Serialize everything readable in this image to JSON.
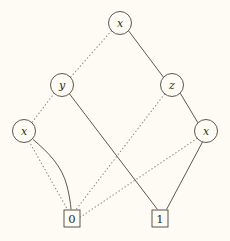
{
  "figure": {
    "kind": "binary-decision-diagram",
    "background_color": "#fdfbf3",
    "line_color": "#4a443c",
    "dotted_line_color": "#8c8478",
    "text_color": "#2e2a24",
    "width": 230,
    "height": 241
  },
  "nodes": [
    {
      "id": "root_x",
      "label": "x",
      "shape": "circle",
      "cx": 120,
      "cy": 23,
      "r": 11.5
    },
    {
      "id": "y",
      "label": "y",
      "shape": "circle",
      "cx": 62,
      "cy": 85,
      "r": 11.5
    },
    {
      "id": "z",
      "label": "z",
      "shape": "circle",
      "cx": 172,
      "cy": 85,
      "r": 11.5
    },
    {
      "id": "x_left",
      "label": "x",
      "shape": "circle",
      "cx": 24,
      "cy": 131,
      "r": 11.5
    },
    {
      "id": "x_right",
      "label": "x",
      "shape": "circle",
      "cx": 206,
      "cy": 131,
      "r": 11.5
    }
  ],
  "terminals": [
    {
      "id": "t0",
      "label": "0",
      "shape": "square",
      "x": 64,
      "y": 210,
      "w": 16,
      "h": 17
    },
    {
      "id": "t1",
      "label": "1",
      "shape": "square",
      "x": 152,
      "y": 210,
      "w": 16,
      "h": 17
    }
  ],
  "edges": [
    {
      "id": "e1",
      "from": "root_x",
      "to": "y",
      "style": "dotted",
      "meaning": "low"
    },
    {
      "id": "e2",
      "from": "root_x",
      "to": "z",
      "style": "solid",
      "meaning": "high"
    },
    {
      "id": "e3",
      "from": "y",
      "to": "x_left",
      "style": "dotted",
      "meaning": "low"
    },
    {
      "id": "e4",
      "from": "y",
      "to": "t1",
      "style": "solid",
      "meaning": "high"
    },
    {
      "id": "e5",
      "from": "z",
      "to": "t0",
      "style": "dotted",
      "meaning": "low"
    },
    {
      "id": "e6",
      "from": "z",
      "to": "x_right",
      "style": "solid",
      "meaning": "high"
    },
    {
      "id": "e7",
      "from": "x_left",
      "to": "t0",
      "style": "dotted",
      "meaning": "low"
    },
    {
      "id": "e8",
      "from": "x_left",
      "to": "t0",
      "style": "solid",
      "meaning": "high",
      "curved": true
    },
    {
      "id": "e9",
      "from": "x_right",
      "to": "t0",
      "style": "dotted",
      "meaning": "low"
    },
    {
      "id": "e10",
      "from": "x_right",
      "to": "t1",
      "style": "solid",
      "meaning": "high"
    }
  ]
}
